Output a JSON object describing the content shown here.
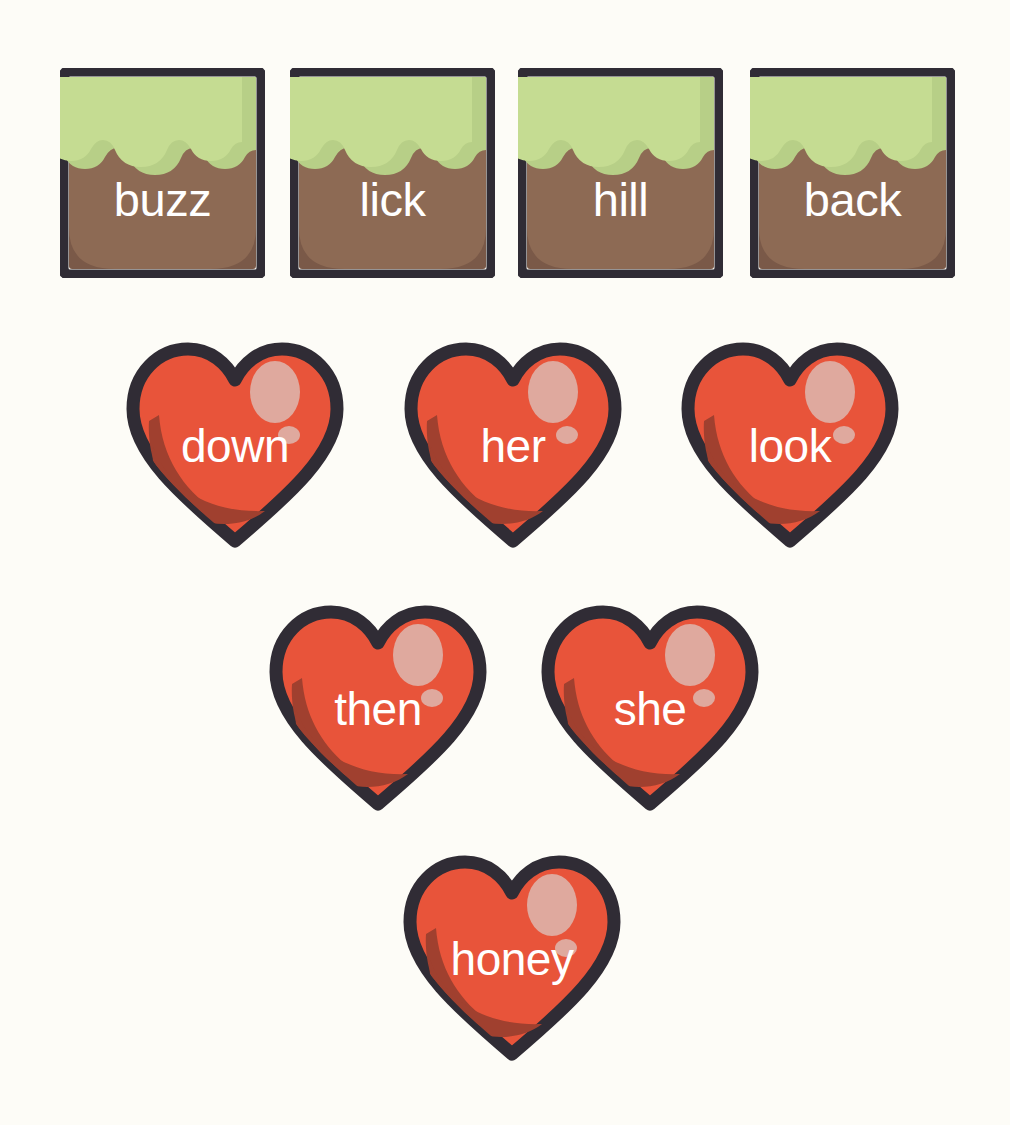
{
  "canvas": {
    "width": 1010,
    "height": 1125,
    "background_color": "#fdfcf7"
  },
  "palette": {
    "outline": "#302c35",
    "tile_green": "#c5dc92",
    "tile_green_shade": "#b7cf87",
    "tile_brown": "#8d6a54",
    "tile_brown_dark": "#7a5948",
    "heart_red": "#e8543a",
    "heart_red_dark": "#a0402f",
    "heart_highlight": "#dfa99e",
    "text_color": "#ffffff"
  },
  "tiles": {
    "shape": "square-card-hill-icon",
    "items": [
      {
        "label": "buzz",
        "x": 60,
        "y": 68
      },
      {
        "label": "lick",
        "x": 290,
        "y": 68
      },
      {
        "label": "hill",
        "x": 518,
        "y": 68
      },
      {
        "label": "back",
        "x": 750,
        "y": 68
      }
    ]
  },
  "hearts": {
    "shape": "heart-card-icon",
    "items": [
      {
        "label": "down",
        "x": 119,
        "y": 335
      },
      {
        "label": "her",
        "x": 397,
        "y": 335
      },
      {
        "label": "look",
        "x": 674,
        "y": 335
      },
      {
        "label": "then",
        "x": 262,
        "y": 598
      },
      {
        "label": "she",
        "x": 534,
        "y": 598
      },
      {
        "label": "honey",
        "x": 396,
        "y": 848
      }
    ]
  }
}
